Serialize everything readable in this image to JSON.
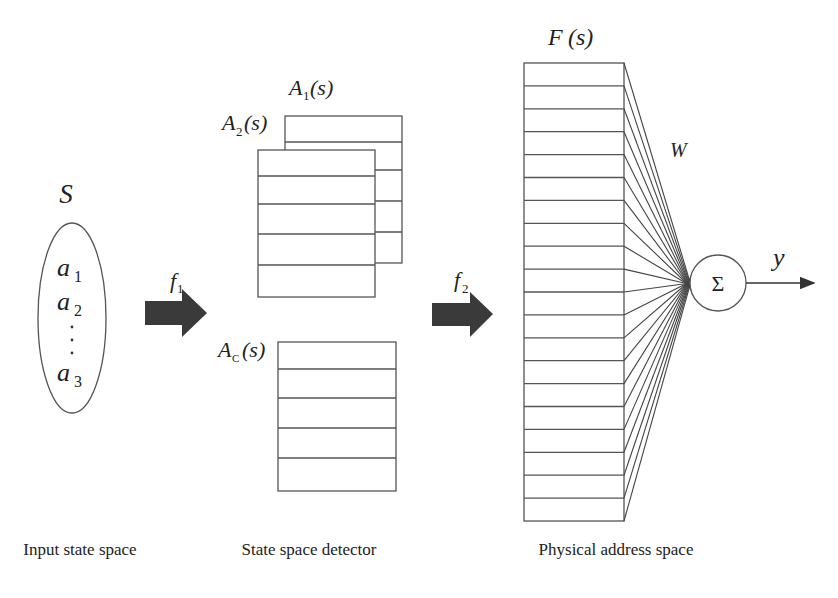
{
  "diagram": {
    "input": {
      "set_label": "S",
      "elements": [
        {
          "base": "a",
          "sub": "1"
        },
        {
          "base": "a",
          "sub": "2"
        },
        {
          "base": "a",
          "sub": "3"
        }
      ],
      "ellipsis": "⋮",
      "caption": "Input state space"
    },
    "mapping1": {
      "label": "f",
      "sub": "1"
    },
    "detector": {
      "tables": [
        {
          "base": "A",
          "sub": "1",
          "arg": "(s)"
        },
        {
          "base": "A",
          "sub": "2",
          "arg": "(s)"
        },
        {
          "base": "A",
          "sub": "C",
          "arg": "(s)"
        }
      ],
      "caption": "State space detector"
    },
    "mapping2": {
      "label": "f",
      "sub": "2"
    },
    "physical": {
      "label": "F",
      "arg": " (s)",
      "rows": 20,
      "caption": "Physical address space"
    },
    "weights": {
      "label": "W"
    },
    "summation": {
      "symbol": "Σ"
    },
    "output": {
      "label": "y"
    },
    "colors": {
      "line": "#555555",
      "arrow_fill": "#3a3a3a",
      "text": "#222222",
      "background": "#ffffff"
    }
  }
}
